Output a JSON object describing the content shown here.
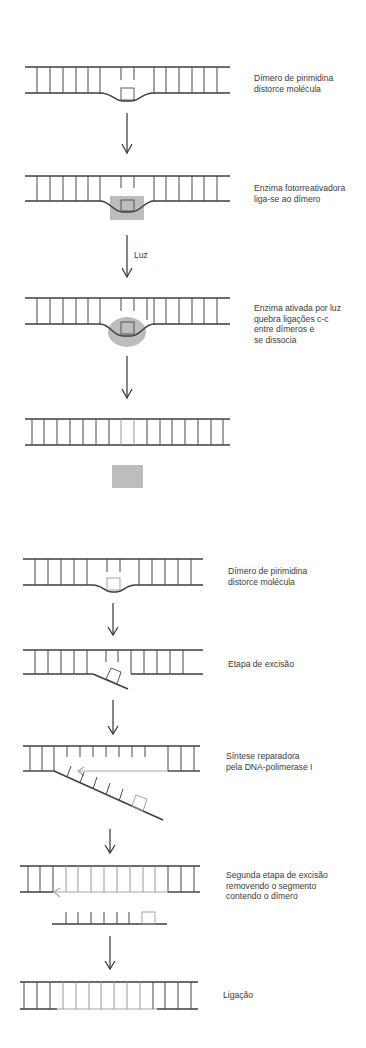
{
  "figure": {
    "panel_photoreactivation": {
      "steps": [
        {
          "id": "dimer-distorts",
          "label_lines": [
            "Dímero de pirimidina",
            "distorce molécula"
          ]
        },
        {
          "id": "enzyme-binds",
          "label_lines": [
            "Enzima fotorreativadora",
            "liga-se ao dímero"
          ]
        },
        {
          "id": "light-activated",
          "label_lines": [
            "Enzima ativada por luz",
            "quebra ligações c-c",
            "entre dímeros e",
            "se dissocia"
          ]
        },
        {
          "id": "repaired",
          "label_lines": []
        }
      ],
      "arrows": [
        {
          "label": ""
        },
        {
          "label": "Luz"
        },
        {
          "label": ""
        }
      ]
    },
    "panel_excision_repair": {
      "steps": [
        {
          "id": "dimer-distorts",
          "label_lines": [
            "Dímero de pirimidina",
            "distorce molécula"
          ]
        },
        {
          "id": "excision",
          "label_lines": [
            "Etapa de excisão"
          ]
        },
        {
          "id": "repair-synthesis",
          "label_lines": [
            "Síntese reparadora",
            "pela DNA-polimerase I"
          ]
        },
        {
          "id": "second-excision",
          "label_lines": [
            "Segunda etapa de excisão",
            "removendo o segmento",
            "contendo o dímero"
          ]
        },
        {
          "id": "ligation",
          "label_lines": [
            "Ligação"
          ]
        }
      ]
    },
    "colors": {
      "strand": "#3c3c3c",
      "new_strand": "#a8a8a8",
      "enzyme": "#bdbdbd",
      "text": "#3a3a3a"
    }
  }
}
